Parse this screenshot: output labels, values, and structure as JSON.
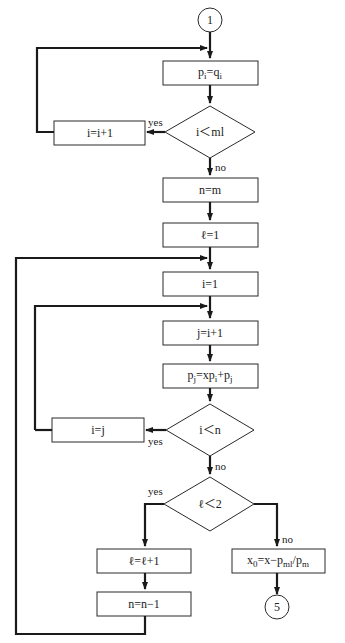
{
  "flowchart": {
    "connectors": {
      "start": "1",
      "end": "5"
    },
    "nodes": {
      "assign_p": {
        "base": "p",
        "sub1": "i",
        "eq": "=q",
        "sub2": "i"
      },
      "cond_i_m": "i＜ml",
      "inc_i": "i=i+1",
      "n_eq_m": "n=m",
      "l_eq_1": "ℓ=1",
      "i_eq_1": "i=1",
      "j_eq_i1": "j=i+1",
      "pj_update": {
        "a": "p",
        "a_sub": "j",
        "b": "=xp",
        "b_sub": "i",
        "c": "+p",
        "c_sub": "j"
      },
      "cond_i_n": "i＜n",
      "i_eq_j": "i=j",
      "cond_l_2": "ℓ＜2",
      "l_inc": "ℓ=ℓ+1",
      "n_dec": "n=n−1",
      "x0_calc": {
        "a": "x",
        "a_sub": "0",
        "b": "=x−p",
        "b_sub": "ml",
        "c": "/p",
        "c_sub": "m"
      }
    },
    "edge_labels": {
      "yes1": "yes",
      "no1": "no",
      "yes2": "yes",
      "no2": "no",
      "yes3": "yes",
      "no3": "no"
    }
  }
}
